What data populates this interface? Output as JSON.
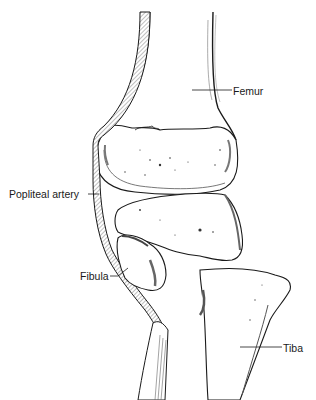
{
  "figure": {
    "labels": {
      "femur": "Femur",
      "popliteal_artery": "Popliteal artery",
      "fibula": "Fibula",
      "tibia": "Tiba"
    },
    "colors": {
      "line": "#1a1a1a",
      "hatch": "#9a9a9a",
      "shade": "#6a6a6a",
      "background": "#ffffff"
    }
  }
}
